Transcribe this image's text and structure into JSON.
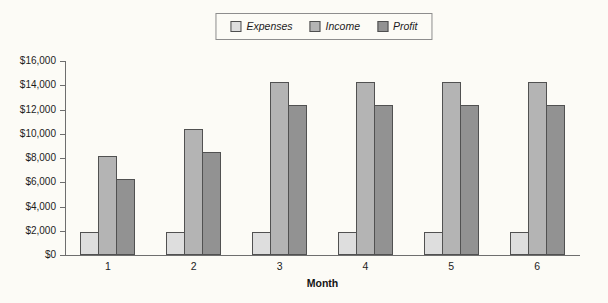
{
  "figure": {
    "background": "#fcfbf6",
    "legend_border_color": "#8d8d8d",
    "axis_color": "#6e6e6e",
    "bar_border_color": "#515151",
    "text_color": "#1c1c1c"
  },
  "chart_data": {
    "type": "bar",
    "title": "",
    "xlabel": "Month",
    "ylabel": "",
    "categories": [
      "1",
      "2",
      "3",
      "4",
      "5",
      "6"
    ],
    "series": [
      {
        "name": "Expenses",
        "color": "#dedede",
        "values": [
          1900,
          1900,
          1900,
          1900,
          1900,
          1900
        ]
      },
      {
        "name": "Income",
        "color": "#b4b4b4",
        "values": [
          8200,
          10400,
          14300,
          14300,
          14300,
          14300
        ]
      },
      {
        "name": "Profit",
        "color": "#929292",
        "values": [
          6300,
          8500,
          12400,
          12400,
          12400,
          12400
        ]
      }
    ],
    "ylim": [
      0,
      16000
    ],
    "y_tick_step": 2000,
    "y_tick_labels": [
      "$0",
      "$2,000",
      "$4,000",
      "$6,000",
      "$8,000",
      "$10,000",
      "$12,000",
      "$14,000",
      "$16,000"
    ],
    "grid": false,
    "legend_position": "top-center"
  }
}
